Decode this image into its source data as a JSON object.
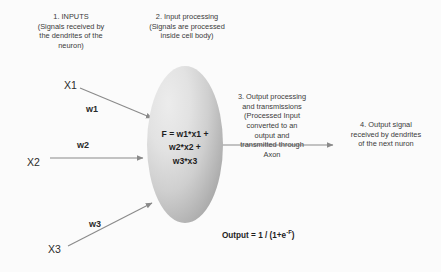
{
  "diagram": {
    "background_color": "#fbfbfb",
    "line_color": "#8a8a8a",
    "soma_fill_light": "#ececec",
    "soma_fill_dark": "#949494"
  },
  "annotations": {
    "inputs": "1. INPUTS\n(Signals received by\nthe dendrites of the\nneuron)",
    "processing": "2. Input processing\n(Signals are processed\ninside cell body)",
    "output_processing": "3. Output processing\nand transmissions\n(Processed Input\nconverted to an\noutput and\ntransmitted through\nAxon",
    "output_signal": "4. Output signal\nreceived by dendrites\nof the next nuron"
  },
  "inputs": [
    {
      "variable": "X1",
      "weight": "w1"
    },
    {
      "variable": "X2",
      "weight": "w2"
    },
    {
      "variable": "X3",
      "weight": "w3"
    }
  ],
  "soma": {
    "formula": "F = w1*x1 +\nw2*x2 +\nw3*x3"
  },
  "output": {
    "formula_prefix": "Output = 1 / (1+e",
    "formula_exponent": "-F",
    "formula_suffix": ")"
  }
}
